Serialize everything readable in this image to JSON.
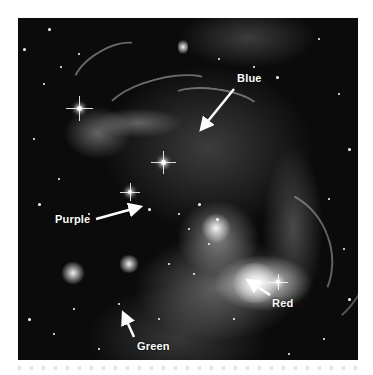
{
  "image": {
    "subject": "nebula-star-field",
    "style": "grayscale astronomical photograph"
  },
  "annotations": [
    {
      "label": "Blue",
      "x": 237,
      "y": 73,
      "arrow": {
        "from": [
          234,
          89
        ],
        "to": [
          202,
          128
        ]
      }
    },
    {
      "label": "Purple",
      "x": 55,
      "y": 214,
      "arrow": {
        "from": [
          96,
          219
        ],
        "to": [
          139,
          207
        ]
      }
    },
    {
      "label": "Red",
      "x": 272,
      "y": 298,
      "arrow": {
        "from": [
          270,
          295
        ],
        "to": [
          249,
          281
        ]
      }
    },
    {
      "label": "Green",
      "x": 137,
      "y": 341,
      "arrow": {
        "from": [
          134,
          337
        ],
        "to": [
          124,
          314
        ]
      }
    }
  ],
  "colors": {
    "label_text": "#ffffff",
    "arrow": "#ffffff",
    "background": "#0b0b0b",
    "page": "#ffffff"
  }
}
